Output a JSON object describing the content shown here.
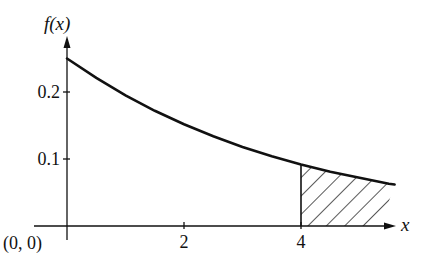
{
  "chart_data": {
    "type": "area",
    "title": "",
    "xlabel": "x",
    "ylabel": "f(x)",
    "origin_label": "(0, 0)",
    "function": "f(x) = 0.25 * exp(-x/4)",
    "x": [
      0,
      0.5,
      1,
      1.5,
      2,
      2.5,
      3,
      3.5,
      4,
      4.5,
      5,
      5.5,
      5.6
    ],
    "series": [
      {
        "name": "f(x)",
        "values": [
          0.25,
          0.221,
          0.195,
          0.172,
          0.152,
          0.134,
          0.118,
          0.104,
          0.092,
          0.081,
          0.072,
          0.063,
          0.062
        ]
      }
    ],
    "shaded_region": {
      "from": 4,
      "to": 5.6,
      "style": "hatched",
      "meaning": "area under f(x) for x > 4"
    },
    "x_ticks": [
      {
        "value": 2,
        "label": "2"
      },
      {
        "value": 4,
        "label": "4"
      }
    ],
    "y_ticks": [
      {
        "value": 0.1,
        "label": "0.1"
      },
      {
        "value": 0.2,
        "label": "0.2"
      }
    ],
    "xlim": [
      0,
      5.8
    ],
    "ylim": [
      0,
      0.27
    ],
    "grid": false,
    "legend": null
  },
  "colors": {
    "ink": "#111111",
    "background": "#ffffff"
  }
}
